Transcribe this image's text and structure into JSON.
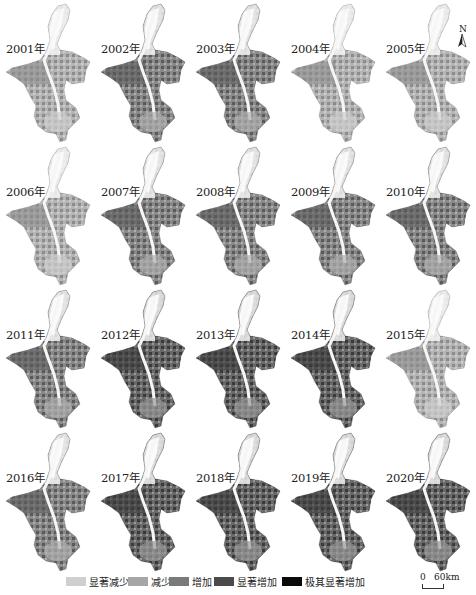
{
  "figure": {
    "panels": [
      {
        "year_label": "2001年",
        "tone": "light"
      },
      {
        "year_label": "2002年",
        "tone": "mid"
      },
      {
        "year_label": "2003年",
        "tone": "mid"
      },
      {
        "year_label": "2004年",
        "tone": "light"
      },
      {
        "year_label": "2005年",
        "tone": "light"
      },
      {
        "year_label": "2006年",
        "tone": "light"
      },
      {
        "year_label": "2007年",
        "tone": "mid"
      },
      {
        "year_label": "2008年",
        "tone": "mid"
      },
      {
        "year_label": "2009年",
        "tone": "mid"
      },
      {
        "year_label": "2010年",
        "tone": "mid"
      },
      {
        "year_label": "2011年",
        "tone": "mid"
      },
      {
        "year_label": "2012年",
        "tone": "dark"
      },
      {
        "year_label": "2013年",
        "tone": "dark"
      },
      {
        "year_label": "2014年",
        "tone": "dark"
      },
      {
        "year_label": "2015年",
        "tone": "light"
      },
      {
        "year_label": "2016年",
        "tone": "mid"
      },
      {
        "year_label": "2017年",
        "tone": "dark"
      },
      {
        "year_label": "2018年",
        "tone": "dark"
      },
      {
        "year_label": "2019年",
        "tone": "dark"
      },
      {
        "year_label": "2020年",
        "tone": "dark"
      }
    ],
    "north_arrow": {
      "label": "N",
      "icon": "north-arrow-icon"
    },
    "legend": {
      "items": [
        {
          "label": "显著减少",
          "color": "#cfcfcf"
        },
        {
          "label": "减少",
          "color": "#a6a6a6"
        },
        {
          "label": "增加",
          "color": "#7a7a7a"
        },
        {
          "label": "显著增加",
          "color": "#4a4a4a"
        },
        {
          "label": "极其显著增加",
          "color": "#0a0a0a"
        }
      ]
    },
    "scale_bar": {
      "start": "0",
      "end": "60km"
    }
  }
}
